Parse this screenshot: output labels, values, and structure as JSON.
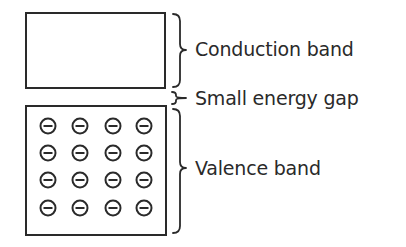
{
  "diagram": {
    "title": "",
    "colors": {
      "stroke": "#2a2a2a",
      "background": "#ffffff"
    },
    "bands": [
      {
        "id": "conduction",
        "label": "Conduction band",
        "box": {
          "x": 26,
          "y": 13,
          "w": 139,
          "h": 75
        },
        "electrons": 0
      },
      {
        "id": "valence",
        "label": "Valence band",
        "box": {
          "x": 26,
          "y": 106,
          "w": 140,
          "h": 129
        },
        "electrons": 16,
        "grid": {
          "cols": [
            48,
            80,
            113,
            144
          ],
          "rows": [
            126,
            153,
            180,
            208
          ],
          "radius": 7.5
        }
      }
    ],
    "gap": {
      "label": "Small energy gap"
    },
    "electron_symbol": "minus-in-circle"
  }
}
